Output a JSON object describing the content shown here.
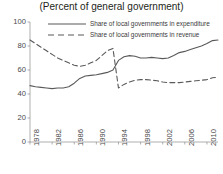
{
  "chart_data": {
    "type": "line",
    "title": "(Percent of general government)",
    "xlabel": "",
    "ylabel": "",
    "xlim": [
      1978,
      2012
    ],
    "ylim": [
      0,
      100
    ],
    "yticks": [
      0,
      20,
      40,
      60,
      80,
      100
    ],
    "xticks": [
      1978,
      1982,
      1986,
      1990,
      1994,
      1998,
      2002,
      2006,
      2010
    ],
    "grid": false,
    "legend_position": "top",
    "x": [
      1978,
      1979,
      1980,
      1981,
      1982,
      1983,
      1984,
      1985,
      1986,
      1987,
      1988,
      1989,
      1990,
      1991,
      1992,
      1993,
      1994,
      1995,
      1996,
      1997,
      1998,
      1999,
      2000,
      2001,
      2002,
      2003,
      2004,
      2005,
      2006,
      2007,
      2008,
      2009,
      2010,
      2011,
      2012
    ],
    "series": [
      {
        "name": "Share of local governments in expenditure",
        "style": "solid",
        "color": "#58595b",
        "values": [
          47,
          46,
          45.5,
          45,
          44.5,
          45,
          45,
          46,
          49,
          53,
          55,
          55.5,
          56,
          57,
          58,
          60,
          68,
          71,
          72,
          71.5,
          70,
          70,
          70.5,
          70,
          69.5,
          70,
          72,
          74.5,
          75.5,
          77,
          78.5,
          80,
          82,
          84.5,
          85
        ]
      },
      {
        "name": "Share of local governments in revenue",
        "style": "dashed",
        "color": "#58595b",
        "values": [
          85,
          82,
          79,
          76,
          73,
          70,
          68,
          66,
          64,
          63,
          64,
          66,
          68,
          72,
          76,
          78,
          45,
          48,
          50,
          51.5,
          52,
          52,
          51.5,
          51,
          50,
          49.5,
          49.5,
          49.5,
          50,
          50.5,
          51,
          51.5,
          52,
          53.5,
          54
        ]
      }
    ],
    "annotations": []
  }
}
